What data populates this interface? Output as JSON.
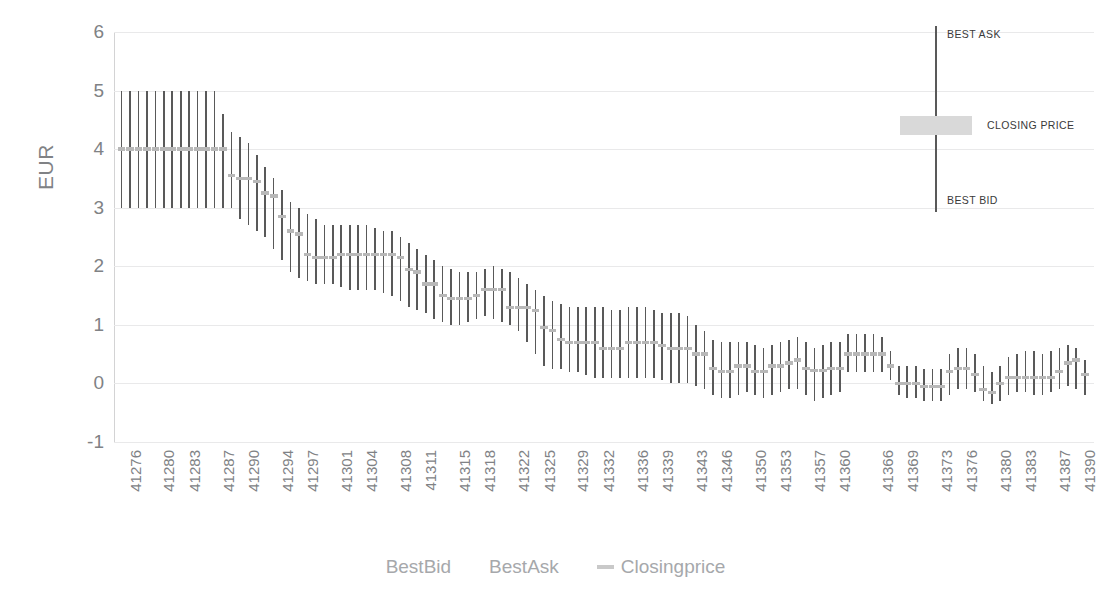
{
  "chart_data": {
    "type": "bar",
    "title": "",
    "subtitle": "",
    "xlabel": "",
    "ylabel": "EUR",
    "ylim": [
      -1,
      6
    ],
    "yticks": [
      6,
      5,
      4,
      3,
      2,
      1,
      0,
      -1
    ],
    "ytick_labels": [
      "6",
      "5",
      "4",
      "3",
      "2",
      "1",
      "0",
      "-1"
    ],
    "grid": true,
    "legend_position": "bottom",
    "legend": [
      {
        "name": "BestBid",
        "marker": "none",
        "color": "#595959"
      },
      {
        "name": "BestAsk",
        "marker": "none",
        "color": "#595959"
      },
      {
        "name": "Closingprice",
        "marker": "line",
        "color": "#c9c9c9"
      }
    ],
    "xtick_labels": [
      "41276",
      "41280",
      "41283",
      "41287",
      "41290",
      "41294",
      "41297",
      "41301",
      "41304",
      "41308",
      "41311",
      "41315",
      "41318",
      "41322",
      "41325",
      "41329",
      "41332",
      "41336",
      "41339",
      "41343",
      "41346",
      "41350",
      "41353",
      "41357",
      "41360",
      "41366",
      "41369",
      "41373",
      "41376",
      "41380",
      "41383",
      "41387",
      "41390",
      "41394"
    ],
    "xtick_indices": [
      0,
      4,
      7,
      11,
      14,
      18,
      21,
      25,
      28,
      32,
      35,
      39,
      42,
      46,
      49,
      53,
      56,
      60,
      63,
      67,
      70,
      74,
      77,
      81,
      84,
      89,
      92,
      96,
      99,
      103,
      106,
      110,
      113,
      117
    ],
    "series": [
      {
        "name": "BestBid",
        "role": "low"
      },
      {
        "name": "BestAsk",
        "role": "high"
      },
      {
        "name": "Closingprice",
        "role": "close"
      }
    ],
    "points": [
      {
        "x": "41276",
        "low": 3.0,
        "high": 5.0,
        "close": 4.0
      },
      {
        "x": "41277",
        "low": 3.0,
        "high": 5.0,
        "close": 4.0
      },
      {
        "x": "41278",
        "low": 3.0,
        "high": 5.0,
        "close": 4.0
      },
      {
        "x": "41279",
        "low": 3.0,
        "high": 5.0,
        "close": 4.0
      },
      {
        "x": "41280",
        "low": 3.0,
        "high": 5.0,
        "close": 4.0
      },
      {
        "x": "41281",
        "low": 3.0,
        "high": 5.0,
        "close": 4.0
      },
      {
        "x": "41282",
        "low": 3.0,
        "high": 5.0,
        "close": 4.0
      },
      {
        "x": "41283",
        "low": 3.0,
        "high": 5.0,
        "close": 4.0
      },
      {
        "x": "41284",
        "low": 3.0,
        "high": 5.0,
        "close": 4.0
      },
      {
        "x": "41285",
        "low": 3.0,
        "high": 5.0,
        "close": 4.0
      },
      {
        "x": "41286",
        "low": 3.0,
        "high": 5.0,
        "close": 4.0
      },
      {
        "x": "41287",
        "low": 3.0,
        "high": 5.0,
        "close": 4.0
      },
      {
        "x": "41288",
        "low": 3.0,
        "high": 4.6,
        "close": 4.0
      },
      {
        "x": "41289",
        "low": 3.0,
        "high": 4.3,
        "close": 3.55
      },
      {
        "x": "41290",
        "low": 2.8,
        "high": 4.2,
        "close": 3.5
      },
      {
        "x": "41291",
        "low": 2.7,
        "high": 4.1,
        "close": 3.5
      },
      {
        "x": "41292",
        "low": 2.6,
        "high": 3.9,
        "close": 3.45
      },
      {
        "x": "41293",
        "low": 2.5,
        "high": 3.7,
        "close": 3.25
      },
      {
        "x": "41294",
        "low": 2.3,
        "high": 3.5,
        "close": 3.2
      },
      {
        "x": "41295",
        "low": 2.1,
        "high": 3.3,
        "close": 2.85
      },
      {
        "x": "41296",
        "low": 1.9,
        "high": 3.1,
        "close": 2.6
      },
      {
        "x": "41297",
        "low": 1.8,
        "high": 3.0,
        "close": 2.55
      },
      {
        "x": "41298",
        "low": 1.75,
        "high": 2.9,
        "close": 2.2
      },
      {
        "x": "41299",
        "low": 1.7,
        "high": 2.8,
        "close": 2.15
      },
      {
        "x": "41300",
        "low": 1.7,
        "high": 2.7,
        "close": 2.15
      },
      {
        "x": "41301",
        "low": 1.7,
        "high": 2.7,
        "close": 2.15
      },
      {
        "x": "41302",
        "low": 1.65,
        "high": 2.7,
        "close": 2.2
      },
      {
        "x": "41303",
        "low": 1.6,
        "high": 2.7,
        "close": 2.2
      },
      {
        "x": "41304",
        "low": 1.6,
        "high": 2.7,
        "close": 2.2
      },
      {
        "x": "41305",
        "low": 1.6,
        "high": 2.7,
        "close": 2.2
      },
      {
        "x": "41306",
        "low": 1.6,
        "high": 2.65,
        "close": 2.2
      },
      {
        "x": "41307",
        "low": 1.55,
        "high": 2.6,
        "close": 2.2
      },
      {
        "x": "41308",
        "low": 1.5,
        "high": 2.6,
        "close": 2.2
      },
      {
        "x": "41309",
        "low": 1.4,
        "high": 2.5,
        "close": 2.15
      },
      {
        "x": "41310",
        "low": 1.3,
        "high": 2.4,
        "close": 1.95
      },
      {
        "x": "41311",
        "low": 1.25,
        "high": 2.3,
        "close": 1.9
      },
      {
        "x": "41312",
        "low": 1.2,
        "high": 2.2,
        "close": 1.7
      },
      {
        "x": "41313",
        "low": 1.1,
        "high": 2.1,
        "close": 1.7
      },
      {
        "x": "41314",
        "low": 1.05,
        "high": 2.0,
        "close": 1.5
      },
      {
        "x": "41315",
        "low": 1.0,
        "high": 1.95,
        "close": 1.45
      },
      {
        "x": "41316",
        "low": 1.0,
        "high": 1.9,
        "close": 1.45
      },
      {
        "x": "41317",
        "low": 1.05,
        "high": 1.9,
        "close": 1.45
      },
      {
        "x": "41318",
        "low": 1.1,
        "high": 1.9,
        "close": 1.5
      },
      {
        "x": "41319",
        "low": 1.15,
        "high": 1.95,
        "close": 1.6
      },
      {
        "x": "41320",
        "low": 1.1,
        "high": 2.0,
        "close": 1.6
      },
      {
        "x": "41321",
        "low": 1.05,
        "high": 1.95,
        "close": 1.6
      },
      {
        "x": "41322",
        "low": 1.0,
        "high": 1.9,
        "close": 1.3
      },
      {
        "x": "41323",
        "low": 0.9,
        "high": 1.8,
        "close": 1.3
      },
      {
        "x": "41324",
        "low": 0.7,
        "high": 1.7,
        "close": 1.3
      },
      {
        "x": "41325",
        "low": 0.5,
        "high": 1.6,
        "close": 1.25
      },
      {
        "x": "41326",
        "low": 0.3,
        "high": 1.5,
        "close": 0.95
      },
      {
        "x": "41327",
        "low": 0.25,
        "high": 1.4,
        "close": 0.9
      },
      {
        "x": "41328",
        "low": 0.25,
        "high": 1.35,
        "close": 0.75
      },
      {
        "x": "41329",
        "low": 0.2,
        "high": 1.3,
        "close": 0.7
      },
      {
        "x": "41330",
        "low": 0.2,
        "high": 1.3,
        "close": 0.7
      },
      {
        "x": "41331",
        "low": 0.15,
        "high": 1.3,
        "close": 0.7
      },
      {
        "x": "41332",
        "low": 0.1,
        "high": 1.3,
        "close": 0.7
      },
      {
        "x": "41333",
        "low": 0.1,
        "high": 1.3,
        "close": 0.6
      },
      {
        "x": "41334",
        "low": 0.1,
        "high": 1.25,
        "close": 0.6
      },
      {
        "x": "41335",
        "low": 0.1,
        "high": 1.25,
        "close": 0.6
      },
      {
        "x": "41336",
        "low": 0.1,
        "high": 1.3,
        "close": 0.7
      },
      {
        "x": "41337",
        "low": 0.1,
        "high": 1.3,
        "close": 0.7
      },
      {
        "x": "41338",
        "low": 0.1,
        "high": 1.3,
        "close": 0.7
      },
      {
        "x": "41339",
        "low": 0.1,
        "high": 1.25,
        "close": 0.7
      },
      {
        "x": "41340",
        "low": 0.05,
        "high": 1.2,
        "close": 0.65
      },
      {
        "x": "41341",
        "low": 0.0,
        "high": 1.2,
        "close": 0.6
      },
      {
        "x": "41342",
        "low": 0.0,
        "high": 1.2,
        "close": 0.6
      },
      {
        "x": "41343",
        "low": 0.0,
        "high": 1.15,
        "close": 0.6
      },
      {
        "x": "41344",
        "low": -0.05,
        "high": 1.0,
        "close": 0.5
      },
      {
        "x": "41345",
        "low": -0.1,
        "high": 0.9,
        "close": 0.5
      },
      {
        "x": "41346",
        "low": -0.2,
        "high": 0.75,
        "close": 0.25
      },
      {
        "x": "41347",
        "low": -0.25,
        "high": 0.7,
        "close": 0.2
      },
      {
        "x": "41348",
        "low": -0.25,
        "high": 0.7,
        "close": 0.2
      },
      {
        "x": "41349",
        "low": -0.2,
        "high": 0.7,
        "close": 0.3
      },
      {
        "x": "41350",
        "low": -0.15,
        "high": 0.7,
        "close": 0.3
      },
      {
        "x": "41351",
        "low": -0.2,
        "high": 0.65,
        "close": 0.2
      },
      {
        "x": "41352",
        "low": -0.25,
        "high": 0.6,
        "close": 0.2
      },
      {
        "x": "41353",
        "low": -0.2,
        "high": 0.65,
        "close": 0.3
      },
      {
        "x": "41354",
        "low": -0.15,
        "high": 0.7,
        "close": 0.3
      },
      {
        "x": "41355",
        "low": -0.1,
        "high": 0.75,
        "close": 0.35
      },
      {
        "x": "41356",
        "low": -0.1,
        "high": 0.8,
        "close": 0.4
      },
      {
        "x": "41357",
        "low": -0.2,
        "high": 0.7,
        "close": 0.25
      },
      {
        "x": "41358",
        "low": -0.3,
        "high": 0.6,
        "close": 0.22
      },
      {
        "x": "41359",
        "low": -0.25,
        "high": 0.65,
        "close": 0.22
      },
      {
        "x": "41360",
        "low": -0.2,
        "high": 0.7,
        "close": 0.25
      },
      {
        "x": "41361",
        "low": -0.15,
        "high": 0.7,
        "close": 0.25
      },
      {
        "x": "41366",
        "low": 0.2,
        "high": 0.85,
        "close": 0.5
      },
      {
        "x": "41367",
        "low": 0.2,
        "high": 0.85,
        "close": 0.5
      },
      {
        "x": "41368",
        "low": 0.2,
        "high": 0.85,
        "close": 0.5
      },
      {
        "x": "41369",
        "low": 0.2,
        "high": 0.85,
        "close": 0.5
      },
      {
        "x": "41370",
        "low": 0.2,
        "high": 0.8,
        "close": 0.5
      },
      {
        "x": "41371",
        "low": 0.05,
        "high": 0.55,
        "close": 0.3
      },
      {
        "x": "41372",
        "low": -0.2,
        "high": 0.3,
        "close": 0.0
      },
      {
        "x": "41373",
        "low": -0.25,
        "high": 0.3,
        "close": 0.0
      },
      {
        "x": "41374",
        "low": -0.25,
        "high": 0.3,
        "close": 0.0
      },
      {
        "x": "41375",
        "low": -0.3,
        "high": 0.25,
        "close": -0.05
      },
      {
        "x": "41376",
        "low": -0.3,
        "high": 0.25,
        "close": -0.05
      },
      {
        "x": "41377",
        "low": -0.3,
        "high": 0.25,
        "close": -0.05
      },
      {
        "x": "41378",
        "low": -0.2,
        "high": 0.5,
        "close": 0.2
      },
      {
        "x": "41379",
        "low": -0.1,
        "high": 0.6,
        "close": 0.25
      },
      {
        "x": "41380",
        "low": -0.1,
        "high": 0.6,
        "close": 0.25
      },
      {
        "x": "41381",
        "low": -0.15,
        "high": 0.5,
        "close": 0.15
      },
      {
        "x": "41382",
        "low": -0.3,
        "high": 0.3,
        "close": -0.1
      },
      {
        "x": "41383",
        "low": -0.35,
        "high": 0.2,
        "close": -0.15
      },
      {
        "x": "41384",
        "low": -0.3,
        "high": 0.3,
        "close": 0.0
      },
      {
        "x": "41385",
        "low": -0.2,
        "high": 0.45,
        "close": 0.1
      },
      {
        "x": "41386",
        "low": -0.15,
        "high": 0.5,
        "close": 0.1
      },
      {
        "x": "41387",
        "low": -0.15,
        "high": 0.55,
        "close": 0.1
      },
      {
        "x": "41388",
        "low": -0.2,
        "high": 0.55,
        "close": 0.1
      },
      {
        "x": "41389",
        "low": -0.2,
        "high": 0.5,
        "close": 0.1
      },
      {
        "x": "41390",
        "low": -0.15,
        "high": 0.55,
        "close": 0.1
      },
      {
        "x": "41391",
        "low": -0.1,
        "high": 0.6,
        "close": 0.2
      },
      {
        "x": "41392",
        "low": -0.05,
        "high": 0.65,
        "close": 0.35
      },
      {
        "x": "41393",
        "low": -0.1,
        "high": 0.6,
        "close": 0.4
      },
      {
        "x": "41394",
        "low": -0.2,
        "high": 0.4,
        "close": 0.15
      }
    ]
  },
  "annotation": {
    "best_ask_label": "BEST ASK",
    "closing_price_label": "CLOSING PRICE",
    "best_bid_label": "BEST BID"
  },
  "colors": {
    "bar": "#595959",
    "close": "#b8b8b8",
    "grid": "#e9e9ea",
    "text": "#808285",
    "legend_text": "#a6a8ab"
  }
}
